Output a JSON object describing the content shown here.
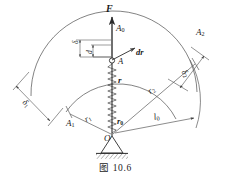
{
  "figure": {
    "caption": "图 10.6",
    "stroke_color": "#3a3a3a",
    "text_color": "#1a1a1a"
  },
  "labels": {
    "force": "F",
    "point_a0": "A",
    "point_a0_sub": "0",
    "point_a1": "A",
    "point_a1_sub": "1",
    "point_a2": "A",
    "point_a2_sub": "2",
    "point_a": "A",
    "origin": "O",
    "radius_vector": "r",
    "radius_increment": "dr",
    "radius_r0": "r",
    "radius_r0_sub": "0",
    "radius_r1": "r",
    "radius_r1_sub": "1",
    "radius_r2": "r",
    "radius_r2_sub": "2",
    "length_l0": "l",
    "length_l0_sub": "0",
    "delta": "δ",
    "d_small": "d",
    "delta1": "δ",
    "delta1_sub": "1",
    "delta2": "δ",
    "delta2_sub": "2"
  }
}
